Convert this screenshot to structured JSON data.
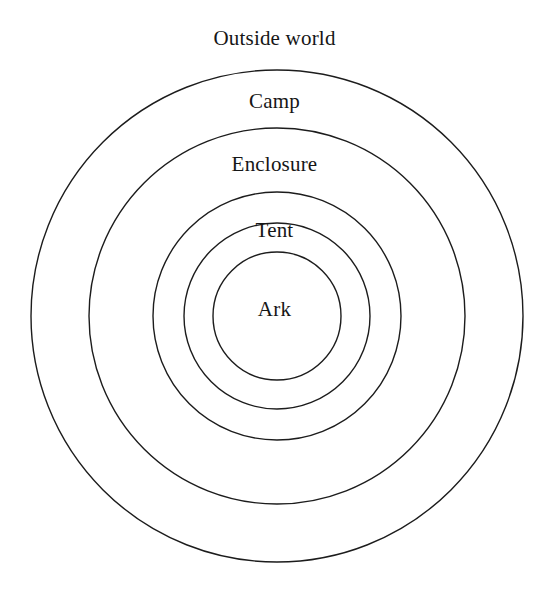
{
  "diagram": {
    "type": "concentric-circles",
    "background_color": "#ffffff",
    "stroke_color": "#1c1c1c",
    "center": {
      "x": 277,
      "y": 316
    },
    "rings": [
      {
        "id": "outside-world",
        "label": "Outside world",
        "radius": 246,
        "label_y": 42,
        "level": 1
      },
      {
        "id": "camp",
        "label": "Camp",
        "radius": 188,
        "label_y": 105,
        "level": 2
      },
      {
        "id": "enclosure",
        "label": "Enclosure",
        "radius": 124,
        "label_y": 168,
        "level": 3
      },
      {
        "id": "tent",
        "label": "Tent",
        "radius": 93,
        "label_y": 234,
        "level": 4
      },
      {
        "id": "ark",
        "label": "Ark",
        "radius": 64,
        "label_y": 313,
        "level": 5
      }
    ]
  }
}
